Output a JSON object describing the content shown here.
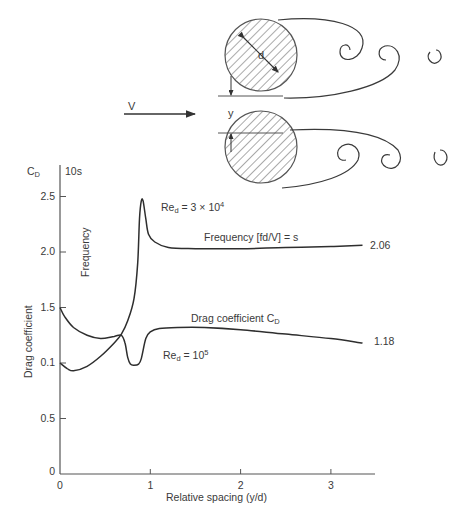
{
  "diagram": {
    "flow_label": "V",
    "gap_label": "y",
    "diameter_label": "d"
  },
  "axes": {
    "y_top_label_main": "C",
    "y_top_label_sub": "D",
    "y_top_label_secondary": "10s",
    "ylabel": "Drag coefficient",
    "xlabel": "Relative spacing (y/d)",
    "y_ticks": [
      {
        "label": "2.5",
        "value": 2.5
      },
      {
        "label": "2.0",
        "value": 2.0
      },
      {
        "label": "1.5",
        "value": 1.5
      },
      {
        "label": "0.1",
        "value": 1.0
      },
      {
        "label": "0.5",
        "value": 0.5
      },
      {
        "label": "0",
        "value": 0
      }
    ],
    "x_ticks": [
      {
        "label": "0",
        "value": 0
      },
      {
        "label": "1",
        "value": 1
      },
      {
        "label": "2",
        "value": 2
      },
      {
        "label": "3",
        "value": 3
      }
    ]
  },
  "annotations": {
    "freq_curve_vertical_label": "Frequency",
    "re_high": {
      "main": "Re",
      "sub": "d",
      "rest": " = 3 × 10",
      "sup": "4"
    },
    "re_low": {
      "main": "Re",
      "sub": "d",
      "rest": " = 10",
      "sup": "5"
    },
    "freq_series_label": "Frequency [fd/V] = s",
    "drag_series_label_main": "Drag coefficient C",
    "drag_series_label_sub": "D",
    "freq_end_value": "2.06",
    "drag_end_value": "1.18"
  },
  "chart_data": {
    "type": "line",
    "title": "",
    "xlabel": "Relative spacing (y/d)",
    "ylabel": "Drag coefficient",
    "secondary_ylabel": "10s",
    "xlim": [
      0,
      3.5
    ],
    "ylim": [
      0,
      2.7
    ],
    "grid": false,
    "legend": "inline annotations",
    "series": [
      {
        "name": "Frequency [fd/V] = s (Re_d = 3 × 10^4)",
        "x": [
          0,
          0.08,
          0.15,
          0.3,
          0.45,
          0.6,
          0.68,
          0.75,
          0.82,
          0.86,
          0.88,
          0.9,
          0.92,
          0.95,
          0.98,
          1.05,
          1.2,
          1.5,
          2.0,
          2.5,
          3.0,
          3.35
        ],
        "y": [
          1.0,
          0.95,
          0.93,
          0.97,
          1.06,
          1.18,
          1.26,
          1.38,
          1.58,
          1.9,
          2.3,
          2.46,
          2.46,
          2.3,
          2.16,
          2.09,
          2.04,
          2.03,
          2.03,
          2.04,
          2.05,
          2.06
        ]
      },
      {
        "name": "Drag coefficient C_D (Re_d = 10^5)",
        "x": [
          0,
          0.05,
          0.15,
          0.3,
          0.45,
          0.6,
          0.68,
          0.72,
          0.75,
          0.78,
          0.82,
          0.87,
          0.9,
          0.95,
          1.0,
          1.1,
          1.3,
          1.6,
          2.0,
          2.5,
          3.0,
          3.35
        ],
        "y": [
          1.5,
          1.42,
          1.32,
          1.25,
          1.22,
          1.24,
          1.25,
          1.18,
          1.05,
          0.99,
          0.98,
          0.99,
          1.04,
          1.22,
          1.28,
          1.31,
          1.32,
          1.32,
          1.3,
          1.26,
          1.22,
          1.18
        ]
      }
    ],
    "end_labels": [
      {
        "series": 0,
        "label": "2.06"
      },
      {
        "series": 1,
        "label": "1.18"
      }
    ]
  },
  "style": {
    "ink": "#3a3a3a",
    "background": "#ffffff"
  }
}
